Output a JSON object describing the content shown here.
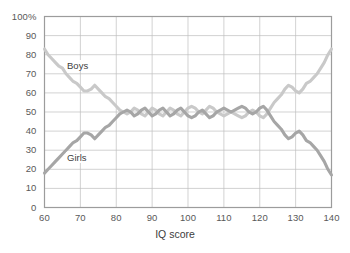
{
  "chart_data": {
    "type": "line",
    "title": "",
    "xlabel": "IQ score",
    "ylabel": "",
    "xlim": [
      60,
      140
    ],
    "ylim": [
      0,
      100
    ],
    "grid": true,
    "legend_position": "inline-annotations",
    "xticks": [
      "60",
      "70",
      "80",
      "90",
      "100",
      "110",
      "120",
      "130",
      "140"
    ],
    "yticks": [
      "0",
      "10",
      "20",
      "30",
      "40",
      "50",
      "60",
      "70",
      "80",
      "90",
      "100%"
    ],
    "x": [
      60,
      61,
      62,
      63,
      64,
      65,
      66,
      67,
      68,
      69,
      70,
      71,
      72,
      73,
      74,
      75,
      76,
      77,
      78,
      79,
      80,
      81,
      82,
      83,
      84,
      85,
      86,
      87,
      88,
      89,
      90,
      91,
      92,
      93,
      94,
      95,
      96,
      97,
      98,
      99,
      100,
      101,
      102,
      103,
      104,
      105,
      106,
      107,
      108,
      109,
      110,
      111,
      112,
      113,
      114,
      115,
      116,
      117,
      118,
      119,
      120,
      121,
      122,
      123,
      124,
      125,
      126,
      127,
      128,
      129,
      130,
      131,
      132,
      133,
      134,
      135,
      136,
      137,
      138,
      139,
      140
    ],
    "series": [
      {
        "name": "Boys",
        "color": "#c9c9c9",
        "values": [
          83,
          80,
          78,
          76,
          74,
          73,
          70,
          68,
          66,
          65,
          63,
          61,
          61,
          62,
          64,
          62,
          60,
          58,
          57,
          55,
          53,
          51,
          50,
          49,
          50,
          52,
          51,
          49,
          48,
          50,
          52,
          51,
          49,
          48,
          50,
          52,
          51,
          49,
          48,
          50,
          52,
          53,
          52,
          50,
          49,
          51,
          53,
          52,
          50,
          49,
          48,
          49,
          50,
          49,
          48,
          47,
          48,
          50,
          51,
          50,
          48,
          47,
          49,
          52,
          55,
          57,
          59,
          62,
          64,
          63,
          61,
          60,
          62,
          65,
          66,
          68,
          70,
          73,
          76,
          80,
          83
        ]
      },
      {
        "name": "Girls",
        "color": "#a6a6a6",
        "values": [
          18,
          20,
          22,
          24,
          26,
          28,
          30,
          32,
          34,
          35,
          37,
          39,
          39,
          38,
          36,
          38,
          40,
          42,
          43,
          45,
          47,
          49,
          50,
          51,
          50,
          48,
          49,
          51,
          52,
          50,
          48,
          49,
          51,
          52,
          50,
          48,
          49,
          51,
          52,
          50,
          48,
          47,
          48,
          50,
          51,
          49,
          47,
          48,
          50,
          51,
          52,
          51,
          50,
          51,
          52,
          53,
          52,
          50,
          49,
          50,
          52,
          53,
          51,
          48,
          45,
          43,
          41,
          38,
          36,
          37,
          39,
          40,
          38,
          35,
          34,
          32,
          30,
          27,
          24,
          20,
          17
        ]
      }
    ],
    "annotations": [
      {
        "text": "Boys",
        "x": 66,
        "y": 74
      },
      {
        "text": "Girls",
        "x": 66,
        "y": 26
      }
    ]
  },
  "axis_style": {
    "grid_color": "#bfbfbf",
    "frame_color": "#9c9c9c",
    "tick_text_color": "#595959"
  }
}
